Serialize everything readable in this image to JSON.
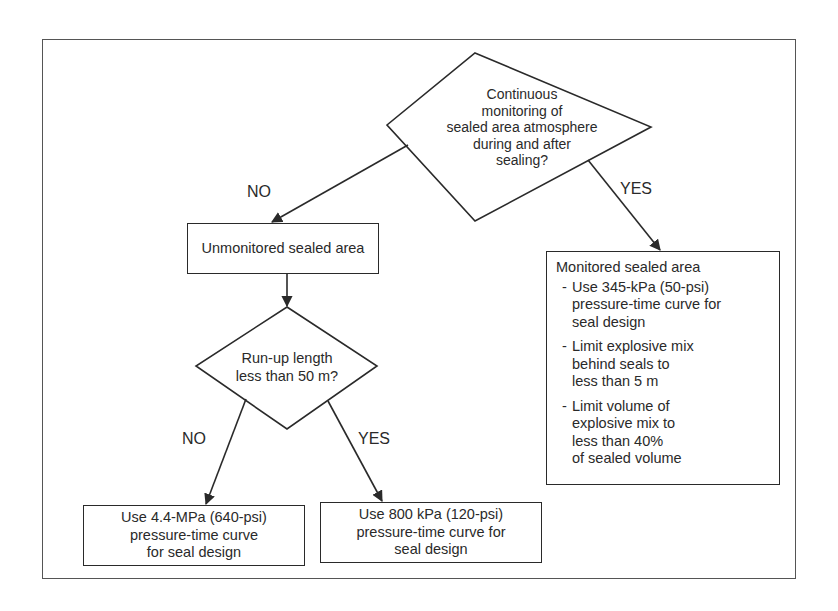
{
  "diagram": {
    "decision_main": {
      "lines": [
        "Continuous",
        "monitoring of",
        "sealed area atmosphere",
        "during and after",
        "sealing?"
      ]
    },
    "branch_main_no": "NO",
    "branch_main_yes": "YES",
    "unmonitored_box": {
      "text": "Unmonitored sealed area"
    },
    "monitored_box": {
      "title": "Monitored sealed area",
      "bullet": "-",
      "items": [
        {
          "lines": [
            "Use 345-kPa (50-psi)",
            "pressure-time curve for",
            "seal design"
          ]
        },
        {
          "lines": [
            "Limit explosive mix",
            "behind seals to",
            "less than 5 m"
          ]
        },
        {
          "lines": [
            "Limit volume of",
            "explosive mix to",
            "less than 40%",
            "of sealed volume"
          ]
        }
      ]
    },
    "decision_runup": {
      "lines": [
        "Run-up length",
        "less than 50 m?"
      ]
    },
    "branch_runup_no": "NO",
    "branch_runup_yes": "YES",
    "outcome_no": {
      "lines": [
        "Use 4.4-MPa (640-psi)",
        "pressure-time curve",
        "for seal design"
      ]
    },
    "outcome_yes": {
      "lines": [
        "Use 800 kPa (120-psi)",
        "pressure-time curve for",
        "seal design"
      ]
    },
    "colors": {
      "stroke": "#2a2a2a",
      "frame": "#555555",
      "background": "#ffffff"
    }
  }
}
